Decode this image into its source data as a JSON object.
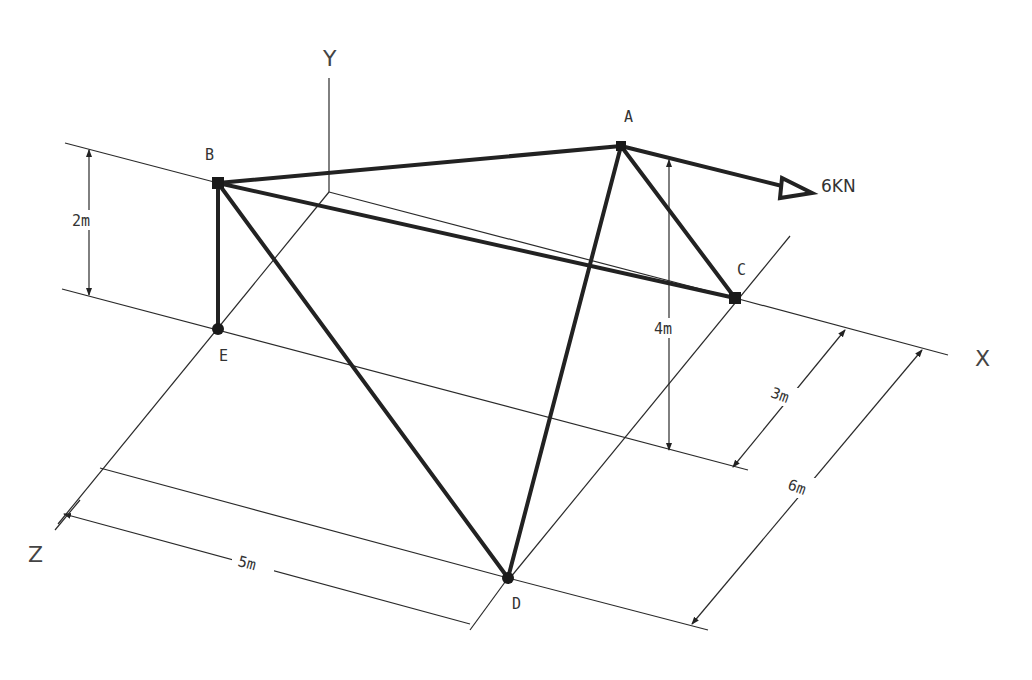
{
  "diagram": {
    "type": "3D space truss with dimensions",
    "axes": {
      "x": "X",
      "y": "Y",
      "z": "Z"
    },
    "joints": {
      "A": "A",
      "B": "B",
      "C": "C",
      "D": "D",
      "E": "E"
    },
    "members": [
      "AB",
      "AC",
      "AD",
      "BC",
      "BD",
      "BE"
    ],
    "load": {
      "label": "6KN",
      "joint": "A",
      "direction": "+X"
    },
    "dimensions": {
      "BE_height": "2m",
      "A_height": "4m",
      "C_offset": "3m",
      "D_z": "6m",
      "D_x": "5m"
    },
    "colors": {
      "ink": "#222222",
      "background": "#ffffff"
    }
  }
}
